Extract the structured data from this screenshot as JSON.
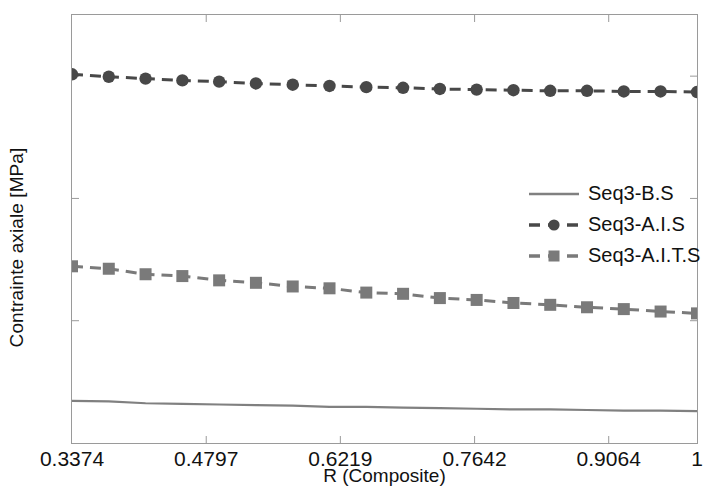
{
  "chart_data": {
    "type": "line",
    "title": "",
    "xlabel": "R (Composite)",
    "ylabel": "Contrainte axiale [MPa]",
    "xlim": [
      0.3374,
      1.0
    ],
    "ylim": [
      70,
      140
    ],
    "grid": false,
    "legend_position": "center-right",
    "xticks": [
      "0.3374",
      "0.4797",
      "0.6219",
      "0.7642",
      "0.9064",
      "1"
    ],
    "xtick_values": [
      0.3374,
      0.4797,
      0.6219,
      0.7642,
      0.9064,
      1.0
    ],
    "yticks": [
      "140",
      "130",
      "110",
      "90",
      "70"
    ],
    "ytick_values": [
      140,
      130,
      110,
      90,
      70
    ],
    "x": [
      0.3374,
      0.3764,
      0.4154,
      0.4544,
      0.4934,
      0.5324,
      0.5714,
      0.6104,
      0.6494,
      0.6884,
      0.7274,
      0.7664,
      0.8054,
      0.8444,
      0.8834,
      0.9224,
      0.9614,
      1.0
    ],
    "series": [
      {
        "name": "Seq3-B.S",
        "color": "#808080",
        "style": "solid",
        "marker": "none",
        "values": [
          76.9,
          76.8,
          76.5,
          76.4,
          76.3,
          76.2,
          76.1,
          75.9,
          75.9,
          75.8,
          75.7,
          75.6,
          75.5,
          75.5,
          75.4,
          75.3,
          75.3,
          75.2
        ]
      },
      {
        "name": "Seq3-A.I.S",
        "color": "#484848",
        "style": "dashed",
        "marker": "circle",
        "values": [
          130.3,
          129.9,
          129.6,
          129.3,
          129.1,
          128.8,
          128.6,
          128.4,
          128.2,
          128.1,
          127.9,
          127.8,
          127.7,
          127.6,
          127.6,
          127.5,
          127.5,
          127.4
        ]
      },
      {
        "name": "Seq3-A.I.T.S",
        "color": "#7a7a7a",
        "style": "dashed",
        "marker": "square",
        "values": [
          98.9,
          98.5,
          97.6,
          97.3,
          96.6,
          96.2,
          95.6,
          95.3,
          94.6,
          94.4,
          93.7,
          93.4,
          92.9,
          92.6,
          92.2,
          91.9,
          91.5,
          91.2
        ]
      }
    ]
  },
  "axis": {
    "ylabel": "Contrainte axiale [MPa]",
    "xlabel": "R (Composite)"
  }
}
